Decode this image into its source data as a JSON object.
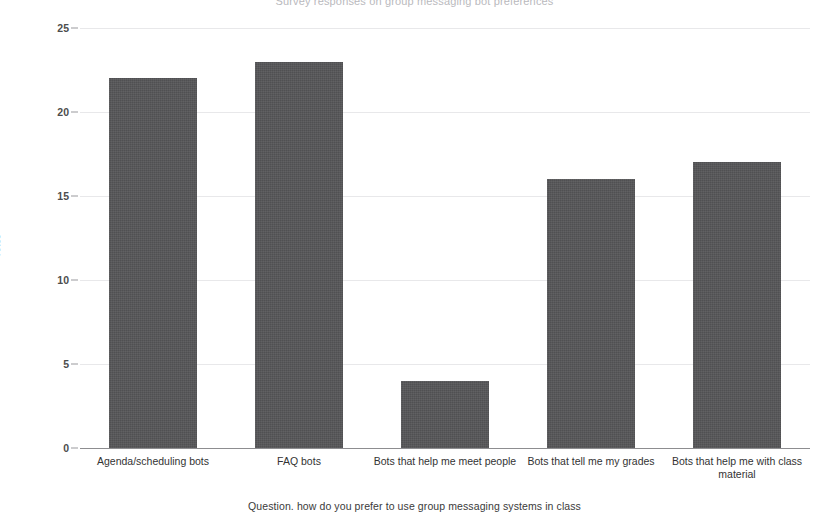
{
  "chart_data": {
    "type": "bar",
    "title": "Survey responses on group messaging bot preferences",
    "title_clipped": true,
    "xlabel": "Question. how do you prefer to use group messaging systems in class",
    "ylabel": "Votes",
    "categories": [
      "Agenda/scheduling bots",
      "FAQ bots",
      "Bots that help me meet people",
      "Bots that tell me my grades",
      "Bots that help me with class material"
    ],
    "values": [
      22,
      23,
      4,
      16,
      17
    ],
    "ylim": [
      0,
      25
    ],
    "yticks": [
      0,
      5,
      10,
      15,
      20,
      25
    ],
    "ytick_labels": [
      "0",
      "5",
      "10",
      "15",
      "20",
      "25"
    ],
    "grid": true,
    "legend": false,
    "bar_color": "#565658",
    "grid_color": "#e8e8ea",
    "axis_color": "#8d8d90",
    "background_color": "#ffffff"
  }
}
